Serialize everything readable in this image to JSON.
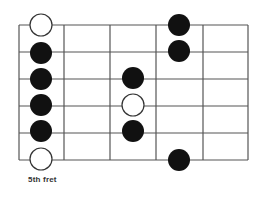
{
  "diagram": {
    "type": "guitar-fretboard-scale-pattern",
    "caption": "5th fret",
    "grid": {
      "x_lines": [
        19,
        64,
        110,
        156,
        203,
        248
      ],
      "y_lines": [
        25,
        52,
        79,
        106,
        133,
        160
      ],
      "line_color": "#555555"
    },
    "dot_radius": 11,
    "colors": {
      "filled": "#111111",
      "open_fill": "#ffffff",
      "open_stroke": "#333333"
    },
    "dots": [
      {
        "fret": 0,
        "string": 1,
        "x": 41,
        "y": 25,
        "style": "open"
      },
      {
        "fret": 0,
        "string": 2,
        "x": 41,
        "y": 53,
        "style": "filled"
      },
      {
        "fret": 0,
        "string": 3,
        "x": 41,
        "y": 79,
        "style": "filled"
      },
      {
        "fret": 0,
        "string": 4,
        "x": 41,
        "y": 105,
        "style": "filled"
      },
      {
        "fret": 0,
        "string": 5,
        "x": 41,
        "y": 131,
        "style": "filled"
      },
      {
        "fret": 0,
        "string": 6,
        "x": 41,
        "y": 159,
        "style": "open"
      },
      {
        "fret": 2,
        "string": 3,
        "x": 133,
        "y": 78,
        "style": "filled"
      },
      {
        "fret": 2,
        "string": 4,
        "x": 133,
        "y": 105,
        "style": "open"
      },
      {
        "fret": 2,
        "string": 5,
        "x": 133,
        "y": 131,
        "style": "filled"
      },
      {
        "fret": 3,
        "string": 1,
        "x": 179,
        "y": 25,
        "style": "filled"
      },
      {
        "fret": 3,
        "string": 2,
        "x": 179,
        "y": 51,
        "style": "filled"
      },
      {
        "fret": 3,
        "string": 6,
        "x": 179,
        "y": 160,
        "style": "filled"
      }
    ]
  }
}
